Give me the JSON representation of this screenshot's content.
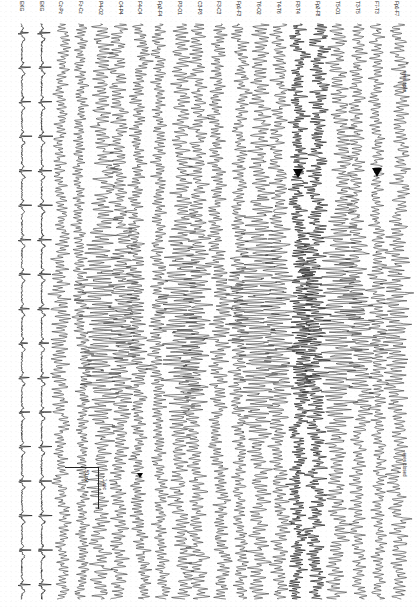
{
  "document": {
    "title": "EEG recording page",
    "orientation": "rotated-90",
    "recording_type": "Longitudinal bipolar montage (double banana) with EKG"
  },
  "annotations": [
    {
      "name": "eyes-closed-annotation",
      "text": "eyes closed",
      "channel_index": 0,
      "time_frac": 0.745
    },
    {
      "name": "eyes-open-annotation",
      "text": "eyes open",
      "channel_index": 0,
      "time_frac": 0.082
    }
  ],
  "scalebar": {
    "amplitude_label": "50 µV",
    "time_label": "1 sec",
    "channel_index": 16,
    "time_frac": 0.77
  },
  "markers": [
    {
      "name": "arrow-marker-1",
      "channel_index": 1,
      "time_frac": 0.251,
      "size": "large"
    },
    {
      "name": "arrow-marker-2",
      "channel_index": 5,
      "time_frac": 0.253,
      "size": "large"
    },
    {
      "name": "arrow-marker-3",
      "channel_index": 13,
      "time_frac": 0.78,
      "size": "small"
    }
  ],
  "chart_data": {
    "type": "line",
    "xlabel": "Time",
    "ylabel": "Channel",
    "x_units": "seconds",
    "y_units": "microvolts",
    "grid": false,
    "legend": "none",
    "duration_seconds": 14.5,
    "sensitivity": "50 µV",
    "timebase": "1 sec",
    "channel_count": 20,
    "categories": [
      "Fp1-F7",
      "F7-T3",
      "T3-T5",
      "T5-O1",
      "Fp2-F8",
      "F8-T4",
      "T4-T6",
      "T6-O2",
      "Fp1-F3",
      "F3-C3",
      "C3-P3",
      "P3-O1",
      "Fp2-F4",
      "F4-C4",
      "C4-P4",
      "P4-O2",
      "Fz-Cz",
      "Cz-Pz",
      "EKG",
      "EKG"
    ],
    "series": [
      {
        "name": "Fp1-F7",
        "kind": "eeg",
        "amp": 7.5,
        "freq": 9.4,
        "noise": 0.55,
        "seed": 11,
        "burst": {
          "start": 0.33,
          "end": 0.7,
          "gain": 1.85,
          "freq": 10.2
        }
      },
      {
        "name": "F7-T3",
        "kind": "eeg",
        "amp": 6.0,
        "freq": 10.1,
        "noise": 0.5,
        "seed": 23,
        "burst": {
          "start": 0.33,
          "end": 0.7,
          "gain": 1.5,
          "freq": 10.4
        }
      },
      {
        "name": "T3-T5",
        "kind": "eeg",
        "amp": 6.8,
        "freq": 9.8,
        "noise": 0.6,
        "seed": 37,
        "burst": {
          "start": 0.33,
          "end": 0.72,
          "gain": 2.1,
          "freq": 9.9
        }
      },
      {
        "name": "T5-O1",
        "kind": "eeg",
        "amp": 8.5,
        "freq": 10.0,
        "noise": 0.45,
        "seed": 41,
        "burst": {
          "start": 0.3,
          "end": 0.74,
          "gain": 2.6,
          "freq": 10.0
        }
      },
      {
        "name": "Fp2-F8",
        "kind": "dense",
        "amp": 7.0,
        "freq": 14.5,
        "noise": 1.05,
        "seed": 53,
        "burst": {
          "start": 0.34,
          "end": 0.7,
          "gain": 1.7,
          "freq": 13.0
        }
      },
      {
        "name": "F8-T4",
        "kind": "dense",
        "amp": 6.4,
        "freq": 16.0,
        "noise": 1.15,
        "seed": 67,
        "burst": {
          "start": 0.34,
          "end": 0.7,
          "gain": 1.6,
          "freq": 15.0
        }
      },
      {
        "name": "T4-T6",
        "kind": "eeg",
        "amp": 7.2,
        "freq": 10.4,
        "noise": 0.6,
        "seed": 71,
        "burst": {
          "start": 0.32,
          "end": 0.72,
          "gain": 2.2,
          "freq": 10.1
        }
      },
      {
        "name": "T6-O2",
        "kind": "eeg",
        "amp": 8.8,
        "freq": 9.9,
        "noise": 0.5,
        "seed": 83,
        "burst": {
          "start": 0.3,
          "end": 0.74,
          "gain": 2.7,
          "freq": 10.0
        }
      },
      {
        "name": "Fp1-F3",
        "kind": "eeg",
        "amp": 6.2,
        "freq": 11.0,
        "noise": 0.55,
        "seed": 97,
        "burst": {
          "start": 0.35,
          "end": 0.68,
          "gain": 1.4,
          "freq": 10.8
        }
      },
      {
        "name": "F3-C3",
        "kind": "eeg",
        "amp": 6.6,
        "freq": 11.6,
        "noise": 0.6,
        "seed": 103,
        "burst": {
          "start": 0.35,
          "end": 0.68,
          "gain": 1.5,
          "freq": 11.2
        }
      },
      {
        "name": "C3-P3",
        "kind": "eeg",
        "amp": 7.4,
        "freq": 10.2,
        "noise": 0.55,
        "seed": 109,
        "burst": {
          "start": 0.33,
          "end": 0.71,
          "gain": 1.9,
          "freq": 10.2
        }
      },
      {
        "name": "P3-O1",
        "kind": "eeg",
        "amp": 8.2,
        "freq": 9.8,
        "noise": 0.5,
        "seed": 127,
        "burst": {
          "start": 0.31,
          "end": 0.73,
          "gain": 2.4,
          "freq": 10.0
        }
      },
      {
        "name": "Fp2-F4",
        "kind": "eeg",
        "amp": 6.0,
        "freq": 11.4,
        "noise": 0.55,
        "seed": 131,
        "burst": {
          "start": 0.35,
          "end": 0.68,
          "gain": 1.4,
          "freq": 11.0
        }
      },
      {
        "name": "F4-C4",
        "kind": "eeg",
        "amp": 6.4,
        "freq": 12.0,
        "noise": 0.6,
        "seed": 149,
        "burst": {
          "start": 0.35,
          "end": 0.68,
          "gain": 1.5,
          "freq": 11.4
        }
      },
      {
        "name": "C4-P4",
        "kind": "eeg",
        "amp": 7.3,
        "freq": 10.4,
        "noise": 0.55,
        "seed": 151,
        "burst": {
          "start": 0.33,
          "end": 0.71,
          "gain": 1.9,
          "freq": 10.3
        }
      },
      {
        "name": "P4-O2",
        "kind": "eeg",
        "amp": 8.4,
        "freq": 9.9,
        "noise": 0.5,
        "seed": 163,
        "burst": {
          "start": 0.31,
          "end": 0.73,
          "gain": 2.4,
          "freq": 10.0
        }
      },
      {
        "name": "Fz-Cz",
        "kind": "eeg",
        "amp": 5.4,
        "freq": 11.8,
        "noise": 0.5,
        "seed": 173,
        "burst": {
          "start": 0.36,
          "end": 0.67,
          "gain": 1.3,
          "freq": 11.2
        }
      },
      {
        "name": "Cz-Pz",
        "kind": "eeg",
        "amp": 5.8,
        "freq": 10.6,
        "noise": 0.5,
        "seed": 181,
        "burst": {
          "start": 0.34,
          "end": 0.7,
          "gain": 1.6,
          "freq": 10.4
        }
      },
      {
        "name": "EKG",
        "kind": "ekg",
        "amp": 11.0,
        "freq": 1.15,
        "noise": 0.14,
        "seed": 191,
        "burst": null
      },
      {
        "name": "EKG",
        "kind": "ekg",
        "amp": 10.0,
        "freq": 1.15,
        "noise": 0.14,
        "seed": 197,
        "burst": null
      }
    ]
  }
}
